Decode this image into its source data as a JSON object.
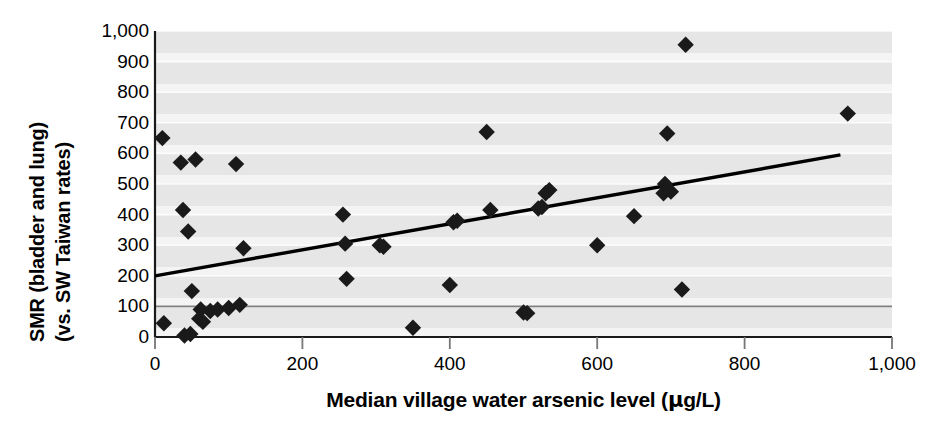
{
  "chart_data": {
    "type": "scatter",
    "title": "",
    "xlabel": "Median village water arsenic level (μg/L)",
    "ylabel_line1": "SMR (bladder and lung)",
    "ylabel_line2": "(vs. SW Taiwan rates)",
    "xlim": [
      0,
      1000
    ],
    "ylim": [
      0,
      1000
    ],
    "xticks": [
      0,
      200,
      400,
      600,
      800,
      1000
    ],
    "xtick_labels": [
      "0",
      "200",
      "400",
      "600",
      "800",
      "1,000"
    ],
    "yticks": [
      0,
      100,
      200,
      300,
      400,
      500,
      600,
      700,
      800,
      900,
      1000
    ],
    "ytick_labels": [
      "0",
      "100",
      "200",
      "300",
      "400",
      "500",
      "600",
      "700",
      "800",
      "900",
      "1,000"
    ],
    "grid": "horizontal-banded",
    "legend": "none",
    "marker": "diamond",
    "marker_color": "#1a1a1a",
    "plot_background": "#e9e9e9",
    "reference_line": {
      "label": "SMR = 100 reference",
      "y": 100,
      "color": "#808080"
    },
    "trendline": {
      "label": "linear fit",
      "color": "#000000",
      "x_start": 0,
      "y_start": 200,
      "x_end": 930,
      "y_end": 595
    },
    "x": [
      10,
      12,
      35,
      38,
      40,
      45,
      48,
      50,
      55,
      60,
      62,
      65,
      75,
      85,
      100,
      110,
      115,
      120,
      255,
      258,
      260,
      305,
      310,
      350,
      400,
      405,
      410,
      450,
      455,
      500,
      505,
      520,
      525,
      530,
      535,
      600,
      650,
      690,
      692,
      695,
      700,
      715,
      720,
      940
    ],
    "y": [
      650,
      45,
      570,
      415,
      5,
      345,
      10,
      150,
      580,
      60,
      90,
      50,
      85,
      90,
      95,
      565,
      105,
      290,
      400,
      305,
      190,
      300,
      295,
      30,
      170,
      375,
      380,
      670,
      415,
      80,
      78,
      420,
      425,
      470,
      480,
      300,
      395,
      470,
      500,
      665,
      475,
      155,
      955,
      730
    ],
    "points": [
      {
        "x": 10,
        "y": 650
      },
      {
        "x": 12,
        "y": 45
      },
      {
        "x": 35,
        "y": 570
      },
      {
        "x": 38,
        "y": 415
      },
      {
        "x": 40,
        "y": 5
      },
      {
        "x": 45,
        "y": 345
      },
      {
        "x": 48,
        "y": 10
      },
      {
        "x": 50,
        "y": 150
      },
      {
        "x": 55,
        "y": 580
      },
      {
        "x": 60,
        "y": 60
      },
      {
        "x": 62,
        "y": 90
      },
      {
        "x": 65,
        "y": 50
      },
      {
        "x": 75,
        "y": 85
      },
      {
        "x": 85,
        "y": 90
      },
      {
        "x": 100,
        "y": 95
      },
      {
        "x": 110,
        "y": 565
      },
      {
        "x": 115,
        "y": 105
      },
      {
        "x": 120,
        "y": 290
      },
      {
        "x": 255,
        "y": 400
      },
      {
        "x": 258,
        "y": 305
      },
      {
        "x": 260,
        "y": 190
      },
      {
        "x": 305,
        "y": 300
      },
      {
        "x": 310,
        "y": 295
      },
      {
        "x": 350,
        "y": 30
      },
      {
        "x": 400,
        "y": 170
      },
      {
        "x": 405,
        "y": 375
      },
      {
        "x": 410,
        "y": 380
      },
      {
        "x": 450,
        "y": 670
      },
      {
        "x": 455,
        "y": 415
      },
      {
        "x": 500,
        "y": 80
      },
      {
        "x": 505,
        "y": 78
      },
      {
        "x": 520,
        "y": 420
      },
      {
        "x": 525,
        "y": 425
      },
      {
        "x": 530,
        "y": 470
      },
      {
        "x": 535,
        "y": 480
      },
      {
        "x": 600,
        "y": 300
      },
      {
        "x": 650,
        "y": 395
      },
      {
        "x": 690,
        "y": 470
      },
      {
        "x": 692,
        "y": 500
      },
      {
        "x": 695,
        "y": 665
      },
      {
        "x": 700,
        "y": 475
      },
      {
        "x": 715,
        "y": 155
      },
      {
        "x": 720,
        "y": 955
      },
      {
        "x": 940,
        "y": 730
      }
    ]
  },
  "axis": {
    "x_title": "Median village water arsenic level (μg/L)",
    "x_title_prefix": "Median village water arsenic level (",
    "x_title_mu": "μ",
    "x_title_suffix": "g/L)",
    "y_title_line1": "SMR (bladder and lung)",
    "y_title_line2": "(vs. SW Taiwan rates)"
  }
}
